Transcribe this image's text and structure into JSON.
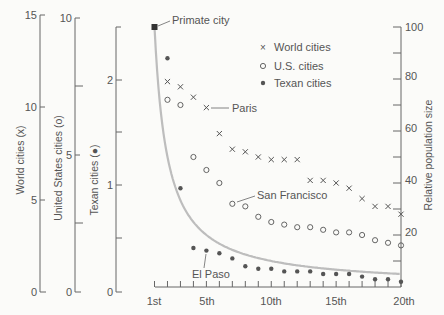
{
  "chart_data": {
    "type": "scatter",
    "title": "",
    "xlabel": "",
    "ylabel": "Relative population size",
    "x_tick_labels": [
      "1st",
      "5th",
      "10th",
      "15th",
      "20th"
    ],
    "x": [
      1,
      2,
      3,
      4,
      5,
      6,
      7,
      8,
      9,
      10,
      11,
      12,
      13,
      14,
      15,
      16,
      17,
      18,
      19,
      20
    ],
    "ylim": [
      0,
      100
    ],
    "y_ticks": [
      20,
      40,
      60,
      80,
      100
    ],
    "grid": false,
    "legend_position": "upper right",
    "series": [
      {
        "name": "World cities",
        "marker": "x",
        "values": [
          100,
          79,
          77,
          73,
          69,
          59,
          53,
          52,
          50,
          49,
          49,
          49,
          41,
          41,
          40,
          38,
          34,
          31,
          31,
          28
        ]
      },
      {
        "name": "U.S. cities",
        "marker": "o",
        "values": [
          100,
          72,
          70,
          50,
          45,
          40,
          32,
          31,
          27,
          25,
          24,
          23,
          23,
          22,
          21,
          21,
          20,
          18,
          17,
          16
        ]
      },
      {
        "name": "Texan cities",
        "marker": "•",
        "values": [
          100,
          88,
          38,
          15,
          14,
          13,
          11,
          8,
          7,
          7,
          6,
          6,
          6,
          5,
          5,
          5,
          4,
          3,
          3,
          2
        ]
      },
      {
        "name": "Rank-size rule curve",
        "marker": "line",
        "values": [
          100,
          50,
          33.3,
          25,
          20,
          16.7,
          14.3,
          12.5,
          11.1,
          10,
          9.1,
          8.3,
          7.7,
          7.1,
          6.7,
          6.3,
          5.9,
          5.6,
          5.3,
          5
        ]
      }
    ],
    "annotations": [
      {
        "text": "Primate city",
        "x": 1,
        "y": 100
      },
      {
        "text": "Paris",
        "x": 5,
        "series": "World cities"
      },
      {
        "text": "San Francisco",
        "x": 7,
        "series": "U.S. cities"
      },
      {
        "text": "El Paso",
        "x": 5,
        "series": "Texan cities"
      }
    ],
    "secondary_axes": [
      {
        "label": "World cities (x)",
        "ticks": [
          0,
          5,
          10,
          15
        ]
      },
      {
        "label": "United States cities (o)",
        "ticks": [
          0,
          5,
          10
        ]
      },
      {
        "label": "Texan cities (●)",
        "ticks": [
          0,
          1,
          2
        ]
      }
    ]
  },
  "labels": {
    "primate": "Primate city",
    "paris": "Paris",
    "sf": "San Francisco",
    "elpaso": "El Paso",
    "ylabel_right": "Relative population size",
    "axis_world": "World cities (x)",
    "axis_us": "United States cities (o)",
    "axis_texan": "Texan cities (●)",
    "legend_world": "World cities",
    "legend_us": "U.S. cities",
    "legend_texan": "Texan cities",
    "world_t0": "0",
    "world_t5": "5",
    "world_t10": "10",
    "world_t15": "15",
    "us_t0": "0",
    "us_t5": "5",
    "us_t10": "10",
    "tx_t0": "0",
    "tx_t1": "1",
    "tx_t2": "2",
    "r20": "20",
    "r40": "40",
    "r60": "60",
    "r80": "80",
    "r100": "100",
    "x1": "1st",
    "x5": "5th",
    "x10": "10th",
    "x15": "15th",
    "x20": "20th"
  },
  "colors": {
    "ink": "#555555",
    "curve": "#bdbdbd",
    "bg": "#fbfbf9"
  }
}
